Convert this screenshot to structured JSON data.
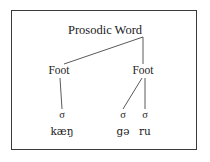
{
  "diagram": {
    "border_color": "#3a3a3a",
    "text_color": "#1b1b1b",
    "line_color": "#5a5a5a",
    "root": {
      "label": "Prosodic Word",
      "x": 105,
      "y": 32
    },
    "feet": [
      {
        "label": "Foot",
        "x": 59,
        "y": 72
      },
      {
        "label": "Foot",
        "x": 143,
        "y": 72
      }
    ],
    "syllables": [
      {
        "label": "σ",
        "x": 62,
        "y": 116
      },
      {
        "label": "σ",
        "x": 123,
        "y": 116
      },
      {
        "label": "σ",
        "x": 145,
        "y": 116
      }
    ],
    "segments": [
      {
        "label": "kæŋ",
        "x": 62,
        "y": 133
      },
      {
        "label": "gə",
        "x": 123,
        "y": 133
      },
      {
        "label": "ru",
        "x": 145,
        "y": 133
      }
    ],
    "edges": [
      {
        "name": "root-to-left-foot",
        "x1": 143,
        "y1": 37,
        "x2": 64,
        "y2": 64
      },
      {
        "name": "root-to-right-foot",
        "x1": 143,
        "y1": 37,
        "x2": 143,
        "y2": 64
      },
      {
        "name": "left-foot-to-sigma1",
        "x1": 60,
        "y1": 78,
        "x2": 62,
        "y2": 109
      },
      {
        "name": "right-foot-to-sigma2",
        "x1": 142,
        "y1": 78,
        "x2": 123,
        "y2": 109
      },
      {
        "name": "right-foot-to-sigma3",
        "x1": 145,
        "y1": 78,
        "x2": 145,
        "y2": 109
      }
    ]
  }
}
